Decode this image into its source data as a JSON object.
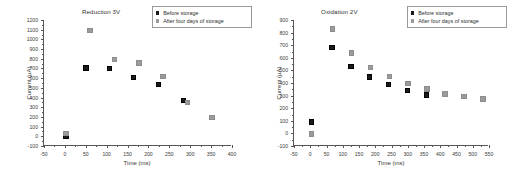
{
  "figure": {
    "background": "#ffffff",
    "marker_colors": {
      "before": "#1a1a1a",
      "after": "#9b9b9b"
    }
  },
  "chart_data": [
    {
      "type": "scatter",
      "title": "Reduction 3V",
      "xlabel": "Time (ms)",
      "ylabel": "Current (µA)",
      "xlim": [
        -50,
        400
      ],
      "ylim": [
        -100,
        1200
      ],
      "xticks": [
        -50,
        0,
        50,
        100,
        150,
        200,
        250,
        300,
        350,
        400
      ],
      "xticklabels": [
        "-50",
        "0",
        "50",
        "100",
        "150",
        "200",
        "250",
        "300",
        "350",
        "400"
      ],
      "yticks": [
        -100,
        0,
        100,
        200,
        300,
        400,
        500,
        600,
        700,
        800,
        900,
        1000,
        1100,
        1200
      ],
      "yticklabels": [
        "-100",
        "0",
        "100",
        "200",
        "300",
        "400",
        "500",
        "600",
        "700",
        "800",
        "900",
        "1000",
        "1100",
        "1200"
      ],
      "grid": false,
      "legend_position": "top-right",
      "series": [
        {
          "name": "Before storage",
          "marker": "filled-square",
          "color": "#1a1a1a",
          "points": [
            {
              "x": 0,
              "y": 10
            },
            {
              "x": 48,
              "y": 715
            },
            {
              "x": 105,
              "y": 707
            },
            {
              "x": 162,
              "y": 620
            },
            {
              "x": 222,
              "y": 548
            },
            {
              "x": 281,
              "y": 382
            }
          ]
        },
        {
          "name": "After four days of storage",
          "marker": "gray-square",
          "color": "#9b9b9b",
          "points": [
            {
              "x": 0,
              "y": 42
            },
            {
              "x": 58,
              "y": 1100
            },
            {
              "x": 117,
              "y": 800
            },
            {
              "x": 175,
              "y": 765
            },
            {
              "x": 232,
              "y": 628
            },
            {
              "x": 291,
              "y": 362
            },
            {
              "x": 350,
              "y": 205
            }
          ]
        }
      ]
    },
    {
      "type": "scatter",
      "title": "Oxidation 2V",
      "xlabel": "Time (ms)",
      "ylabel": "Current (µA)",
      "xlim": [
        -50,
        550
      ],
      "ylim": [
        -100,
        900
      ],
      "xticks": [
        -50,
        0,
        50,
        100,
        150,
        200,
        250,
        300,
        350,
        400,
        450,
        500,
        550
      ],
      "xticklabels": [
        "-50",
        "0",
        "50",
        "100",
        "150",
        "200",
        "250",
        "300",
        "350",
        "400",
        "450",
        "500",
        "550"
      ],
      "yticks": [
        -100,
        0,
        100,
        200,
        300,
        400,
        500,
        600,
        700,
        800,
        900
      ],
      "yticklabels": [
        "-100",
        "0",
        "100",
        "200",
        "300",
        "400",
        "500",
        "600",
        "700",
        "800",
        "900"
      ],
      "grid": false,
      "legend_position": "top-right",
      "series": [
        {
          "name": "Before storage",
          "marker": "filled-square",
          "color": "#1a1a1a",
          "points": [
            {
              "x": 0,
              "y": 97
            },
            {
              "x": 64,
              "y": 688
            },
            {
              "x": 122,
              "y": 537
            },
            {
              "x": 180,
              "y": 456
            },
            {
              "x": 238,
              "y": 396
            },
            {
              "x": 296,
              "y": 349
            },
            {
              "x": 355,
              "y": 312
            }
          ]
        },
        {
          "name": "After four days of storage",
          "marker": "gray-square",
          "color": "#9b9b9b",
          "points": [
            {
              "x": 0,
              "y": 2
            },
            {
              "x": 66,
              "y": 836
            },
            {
              "x": 124,
              "y": 647
            },
            {
              "x": 182,
              "y": 531
            },
            {
              "x": 240,
              "y": 458
            },
            {
              "x": 298,
              "y": 403
            },
            {
              "x": 356,
              "y": 360
            },
            {
              "x": 412,
              "y": 322
            },
            {
              "x": 470,
              "y": 300
            },
            {
              "x": 528,
              "y": 280
            }
          ]
        }
      ]
    }
  ]
}
